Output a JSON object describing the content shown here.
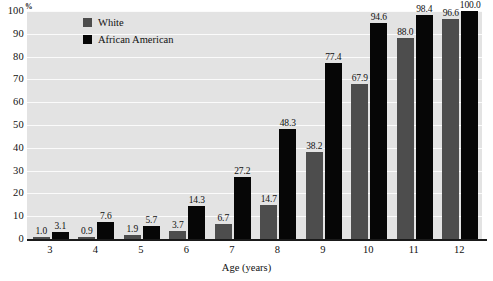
{
  "chart_data": {
    "type": "bar",
    "title": "",
    "subtitle": "",
    "xlabel": "Age (years)",
    "ylabel": "%",
    "categories": [
      "3",
      "4",
      "5",
      "6",
      "7",
      "8",
      "9",
      "10",
      "11",
      "12"
    ],
    "series": [
      {
        "name": "White",
        "color": "#4d4d4d",
        "values": [
          1.0,
          0.9,
          1.9,
          3.7,
          6.7,
          14.7,
          38.2,
          67.9,
          88.0,
          96.6
        ]
      },
      {
        "name": "African American",
        "color": "#060606",
        "values": [
          3.1,
          7.6,
          5.7,
          14.3,
          27.2,
          48.3,
          77.4,
          94.6,
          98.4,
          100.0
        ]
      }
    ],
    "value_labels": {
      "White": [
        "1.0",
        "0.9",
        "1.9",
        "3.7",
        "6.7",
        "14.7",
        "38.2",
        "67.9",
        "88.0",
        "96.6"
      ],
      "African American": [
        "3.1",
        "7.6",
        "5.7",
        "14.3",
        "27.2",
        "48.3",
        "77.4",
        "94.6",
        "98.4",
        "100.0"
      ]
    },
    "ylim": [
      0,
      100
    ],
    "yticks": [
      "0",
      "10",
      "20",
      "30",
      "40",
      "50",
      "60",
      "70",
      "80",
      "90",
      "100"
    ],
    "grid": true,
    "legend_position": "top-left-inside",
    "plot_background": "#e3e3e3",
    "gridline_color": "#fbfbfb"
  },
  "legend": {
    "items": [
      {
        "label": "White",
        "swatch": "#4d4d4d"
      },
      {
        "label": "African American",
        "swatch": "#060606"
      }
    ]
  },
  "axes": {
    "y_unit": "%",
    "x_title": "Age (years)"
  }
}
